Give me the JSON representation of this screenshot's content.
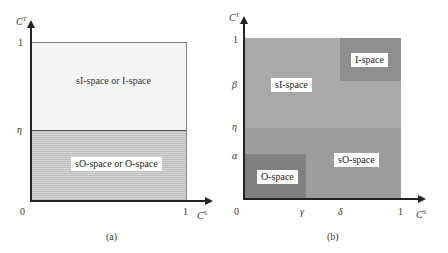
{
  "panel_a": {
    "caption": "(a)",
    "y_axis_label": "C",
    "y_axis_sup": "T",
    "x_axis_label": "C",
    "x_axis_sup": "S",
    "origin": "0",
    "x_tick_max": "1",
    "y_tick_max": "1",
    "y_tick_eta": "η",
    "region_upper_label": "sI-space or I-space",
    "region_lower_label": "sO-space  or O-space",
    "colors": {
      "upper": "#f4f4f4",
      "lower_stripe_dark": "#bcbcbc",
      "lower_stripe_light": "#d6d6d6"
    }
  },
  "panel_b": {
    "caption": "(b)",
    "y_axis_label": "C",
    "y_axis_sup": "T",
    "x_axis_label": "C",
    "x_axis_sup": "S",
    "origin": "0",
    "x_ticks": [
      "γ",
      "δ",
      "1"
    ],
    "y_ticks": [
      "α",
      "η",
      "β",
      "1"
    ],
    "regions": {
      "sI": {
        "label": "sI-space",
        "color": "#a9a9a9"
      },
      "I": {
        "label": "I-space",
        "color": "#8f8f8f"
      },
      "sO": {
        "label": "sO-space",
        "color": "#9d9d9d"
      },
      "O": {
        "label": "O-space",
        "color": "#808080"
      }
    }
  }
}
